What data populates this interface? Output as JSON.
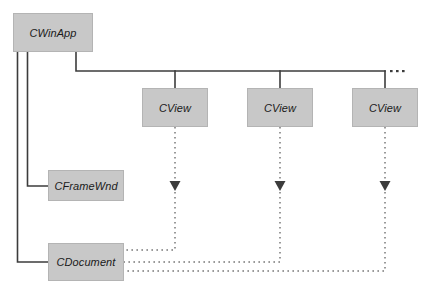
{
  "diagram": {
    "type": "class-relationship-diagram",
    "background_color": "#ffffff",
    "node_fill_color": "#c8c8c8",
    "node_border_color": "#b4b4b4",
    "solid_line_color": "#3c3c3c",
    "dashed_line_color": "#787878",
    "label_color": "#1a1a1a",
    "nodes": [
      {
        "id": "cwinapp",
        "label": "CWinApp",
        "x": 13,
        "y": 13,
        "width": 80,
        "height": 39
      },
      {
        "id": "cview-1",
        "label": "CView",
        "x": 142,
        "y": 88,
        "width": 66,
        "height": 39
      },
      {
        "id": "cview-2",
        "label": "CView",
        "x": 247,
        "y": 88,
        "width": 66,
        "height": 39
      },
      {
        "id": "cview-3",
        "label": "CView",
        "x": 352,
        "y": 88,
        "width": 66,
        "height": 39
      },
      {
        "id": "cframewnd",
        "label": "CFrameWnd",
        "x": 48,
        "y": 170,
        "width": 76,
        "height": 31
      },
      {
        "id": "cdocument",
        "label": "CDocument",
        "x": 48,
        "y": 243,
        "width": 76,
        "height": 38
      }
    ],
    "continuation_dots": {
      "name": "more-views-ellipsis",
      "count": 3,
      "x_start": 390,
      "y": 71,
      "spacing": 6
    },
    "edges": [
      {
        "id": "cwinapp-to-cframewnd",
        "style": "solid",
        "from": "cwinapp",
        "to": "cframewnd"
      },
      {
        "id": "cwinapp-to-cdocument",
        "style": "solid",
        "from": "cwinapp",
        "to": "cdocument"
      },
      {
        "id": "cwinapp-to-views-bus",
        "style": "solid",
        "from": "cwinapp",
        "to": "cview-bus"
      },
      {
        "id": "cview-1-to-cdocument",
        "style": "dashed",
        "from": "cview-1",
        "to": "cdocument",
        "arrow": "down"
      },
      {
        "id": "cview-2-to-cdocument",
        "style": "dashed",
        "from": "cview-2",
        "to": "cdocument",
        "arrow": "down"
      },
      {
        "id": "cview-3-to-cdocument",
        "style": "dashed",
        "from": "cview-3",
        "to": "cdocument",
        "arrow": "down"
      }
    ]
  }
}
